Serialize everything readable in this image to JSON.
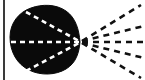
{
  "figure": {
    "canvas": {
      "width": 145,
      "height": 80,
      "background_color": "#ffffff"
    },
    "colors": {
      "ink": "#0d0d0d",
      "blob_fill": "#0a0a0a",
      "inner_dash": "#ffffff",
      "outer_dash": "#111111",
      "border": "#3a3a3a"
    },
    "border": {
      "left_rule": {
        "x": 4,
        "y1": 0,
        "y2": 80,
        "width": 2
      },
      "label": "left vertical rule"
    },
    "blob": {
      "label": "dark silhouette blob",
      "focus_point": {
        "x": 80,
        "y": 42
      },
      "bounds": {
        "left": 10,
        "right": 80,
        "top": 6,
        "bottom": 74
      },
      "path": "M 80 42 C 79 30 76 18 66 11 C 56 4 42 4 31 8 C 19 12 10 23 10 37 C 10 52 17 64 29 70 C 41 76 56 75 66 69 C 76 63 79 53 80 42 Z"
    },
    "inner_dashes": {
      "label": "white dashed chords inside blob, converging at focus",
      "dash_pattern": "5 4",
      "stroke_width": 2.6,
      "lines": [
        {
          "name": "inner-ray-upper",
          "x1": 26,
          "y1": 12,
          "x2": 79,
          "y2": 41
        },
        {
          "name": "inner-ray-axis",
          "x1": 11,
          "y1": 42,
          "x2": 79,
          "y2": 42
        },
        {
          "name": "inner-ray-lower",
          "x1": 26,
          "y1": 71,
          "x2": 79,
          "y2": 43
        }
      ]
    },
    "outer_rays": {
      "label": "black dashed rays fanning right from focus",
      "dash_pattern": "6 5",
      "stroke_width": 2.6,
      "count": 5,
      "lines": [
        {
          "name": "outer-ray-steep-up",
          "x1": 82,
          "y1": 41,
          "x2": 141,
          "y2": 5
        },
        {
          "name": "outer-ray-shallow-up",
          "x1": 82,
          "y1": 41,
          "x2": 144,
          "y2": 26
        },
        {
          "name": "outer-ray-axis",
          "x1": 82,
          "y1": 42,
          "x2": 145,
          "y2": 42
        },
        {
          "name": "outer-ray-shallow-down",
          "x1": 82,
          "y1": 43,
          "x2": 144,
          "y2": 58
        },
        {
          "name": "outer-ray-steep-down",
          "x1": 82,
          "y1": 43,
          "x2": 141,
          "y2": 78
        }
      ]
    }
  }
}
